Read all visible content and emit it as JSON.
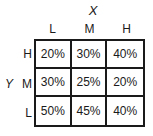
{
  "axes": {
    "x_title": "X",
    "y_title": "Y"
  },
  "columns": [
    "L",
    "M",
    "H"
  ],
  "rows": [
    "H",
    "M",
    "L"
  ],
  "cells": [
    [
      "20%",
      "30%",
      "40%"
    ],
    [
      "30%",
      "25%",
      "20%"
    ],
    [
      "50%",
      "45%",
      "40%"
    ]
  ],
  "colors": {
    "border": "#1a1a1a",
    "text": "#1a1a1a",
    "background": "#ffffff"
  }
}
